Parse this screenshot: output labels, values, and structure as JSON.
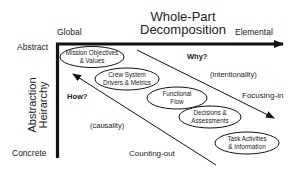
{
  "title": {
    "line1": "Whole-Part",
    "line2": "Decomposition"
  },
  "x_axis": {
    "left_label": "Global",
    "right_label": "Elemental"
  },
  "y_axis": {
    "title_line1": "Abstraction",
    "title_line2": "Heirarchy",
    "top_label": "Abstract",
    "bottom_label": "Concrete"
  },
  "ellipses": [
    {
      "line1": "Mission Objectives",
      "line2": "& Values"
    },
    {
      "line1": "Crew System",
      "line2": "Drivers & Metrics"
    },
    {
      "line1": "Functional",
      "line2": "Flow"
    },
    {
      "line1": "Decisions &",
      "line2": "Assessments"
    },
    {
      "line1": "Task Activities",
      "line2": "& Information"
    }
  ],
  "annotations": {
    "why": "Why?",
    "intentionality": "(intentionality)",
    "focusing_in": "Focusing-in",
    "how": "How?",
    "causality": "(causality)",
    "counting_out": "Counting-out"
  },
  "colors": {
    "ink": "#111111",
    "background": "#ffffff"
  }
}
